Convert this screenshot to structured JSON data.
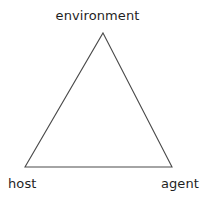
{
  "diagram": {
    "type": "triangle-relationship-diagram",
    "background_color": "#ffffff",
    "stroke_color": "#4a4a4a",
    "text_color": "#1f1f1f",
    "nodes": [
      {
        "id": "environment",
        "label": "environment",
        "position": "top"
      },
      {
        "id": "host",
        "label": "host",
        "position": "bottom-left"
      },
      {
        "id": "agent",
        "label": "agent",
        "position": "bottom-right"
      }
    ],
    "edges": [
      {
        "from": "environment",
        "to": "host"
      },
      {
        "from": "host",
        "to": "agent"
      },
      {
        "from": "agent",
        "to": "environment"
      }
    ],
    "geometry": {
      "apex_x": 103,
      "apex_y": 33,
      "left_x": 25,
      "left_y": 167,
      "right_x": 172,
      "right_y": 167,
      "stroke_width": 1.1
    }
  }
}
